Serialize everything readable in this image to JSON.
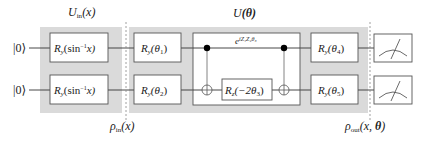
{
  "diagram": {
    "type": "quantum-circuit",
    "colors": {
      "region_fill": "#d9d9d9",
      "box_stroke": "#555555",
      "box_fill": "#ffffff",
      "wire": "#333333",
      "dashed": "#888888",
      "control_dot": "#000000"
    },
    "inputs": [
      {
        "label": "|0⟩",
        "qubit": 1
      },
      {
        "label": "|0⟩",
        "qubit": 2
      }
    ],
    "encoding_block": {
      "title_main": "U",
      "title_sub": "in",
      "title_arg": "(x)",
      "gates": [
        {
          "qubit": 1,
          "name": "R",
          "sub": "y",
          "arg_pre": "(sin",
          "arg_sup": "−1",
          "arg_post": "x)"
        },
        {
          "qubit": 2,
          "name": "R",
          "sub": "y",
          "arg_pre": "(sin",
          "arg_sup": "−1",
          "arg_post": "x)"
        }
      ],
      "state_label_main": "ρ",
      "state_label_sub": "in",
      "state_label_arg": "(x)"
    },
    "variational_block": {
      "title_main": "U",
      "title_arg": "(θ)",
      "first_layer": [
        {
          "qubit": 1,
          "name": "R",
          "sub": "y",
          "arg": "(θ",
          "arg_sub": "1",
          "arg_close": ")"
        },
        {
          "qubit": 2,
          "name": "R",
          "sub": "y",
          "arg": "(θ",
          "arg_sub": "2",
          "arg_close": ")"
        }
      ],
      "entangler": {
        "label_base": "e",
        "label_exp": "iZ₁Z₂θ₃",
        "cnot_1": {
          "control": 1,
          "target": 2
        },
        "middle_gate": {
          "qubit": 2,
          "name": "R",
          "sub": "z",
          "arg": "(−2θ",
          "arg_sub": "3",
          "arg_close": ")"
        },
        "cnot_2": {
          "control": 1,
          "target": 2
        }
      },
      "last_layer": [
        {
          "qubit": 1,
          "name": "R",
          "sub": "y",
          "arg": "(θ",
          "arg_sub": "4",
          "arg_close": ")"
        },
        {
          "qubit": 2,
          "name": "R",
          "sub": "y",
          "arg": "(θ",
          "arg_sub": "5",
          "arg_close": ")"
        }
      ]
    },
    "output_state": {
      "label_main": "ρ",
      "label_sub": "out",
      "label_arg_open": "(x, ",
      "label_arg_theta": "θ",
      "label_arg_close": ")"
    },
    "measurements": [
      {
        "qubit": 1,
        "icon": "meter-icon"
      },
      {
        "qubit": 2,
        "icon": "meter-icon"
      }
    ]
  }
}
